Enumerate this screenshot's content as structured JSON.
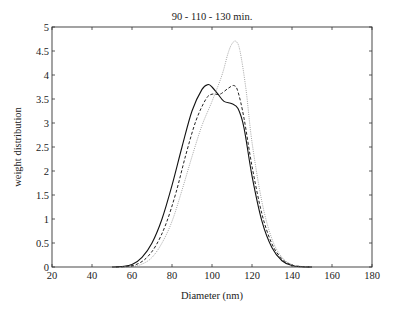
{
  "chart_data": {
    "type": "line",
    "title": "90 - 110 - 130 min.",
    "xlabel": "Diameter (nm)",
    "ylabel": "weight distribution",
    "xlim": [
      20,
      180
    ],
    "ylim": [
      0,
      5
    ],
    "xticks": [
      20,
      40,
      60,
      80,
      100,
      120,
      140,
      160,
      180
    ],
    "yticks": [
      0,
      0.5,
      1,
      1.5,
      2,
      2.5,
      3,
      3.5,
      4,
      4.5,
      5
    ],
    "xtick_labels": [
      "20",
      "40",
      "60",
      "80",
      "100",
      "120",
      "140",
      "160",
      "180"
    ],
    "ytick_labels": [
      "0",
      "0.5",
      "1",
      "1.5",
      "2",
      "2.5",
      "3",
      "3.5",
      "4",
      "4.5",
      "5"
    ],
    "grid": false,
    "legend": null,
    "series": [
      {
        "name": "90 min",
        "style": "solid",
        "color": "#111111",
        "x": [
          50,
          55,
          60,
          65,
          70,
          75,
          80,
          85,
          90,
          95,
          98,
          100,
          103,
          106,
          110,
          113,
          116,
          120,
          125,
          130,
          135,
          140,
          145,
          150
        ],
        "y": [
          0,
          0.01,
          0.05,
          0.2,
          0.5,
          1.0,
          1.7,
          2.5,
          3.25,
          3.7,
          3.8,
          3.75,
          3.6,
          3.45,
          3.4,
          3.3,
          2.9,
          1.9,
          0.95,
          0.4,
          0.13,
          0.03,
          0.005,
          0
        ]
      },
      {
        "name": "110 min",
        "style": "dashed",
        "color": "#222222",
        "x": [
          52,
          57,
          62,
          67,
          72,
          77,
          82,
          87,
          92,
          97,
          100,
          104,
          108,
          111,
          113,
          116,
          120,
          125,
          130,
          135,
          140,
          145,
          150
        ],
        "y": [
          0,
          0.01,
          0.05,
          0.18,
          0.45,
          0.9,
          1.55,
          2.35,
          3.05,
          3.5,
          3.6,
          3.6,
          3.72,
          3.78,
          3.65,
          3.1,
          2.1,
          1.1,
          0.48,
          0.17,
          0.04,
          0.008,
          0
        ]
      },
      {
        "name": "130 min",
        "style": "dotted",
        "color": "#999999",
        "x": [
          55,
          60,
          65,
          70,
          75,
          80,
          85,
          90,
          95,
          100,
          105,
          108,
          110,
          112,
          114,
          117,
          120,
          125,
          130,
          135,
          140,
          145,
          150
        ],
        "y": [
          0,
          0.01,
          0.06,
          0.2,
          0.5,
          0.95,
          1.6,
          2.3,
          2.95,
          3.45,
          4.0,
          4.45,
          4.65,
          4.7,
          4.5,
          3.7,
          2.6,
          1.35,
          0.58,
          0.2,
          0.05,
          0.01,
          0
        ]
      }
    ]
  }
}
